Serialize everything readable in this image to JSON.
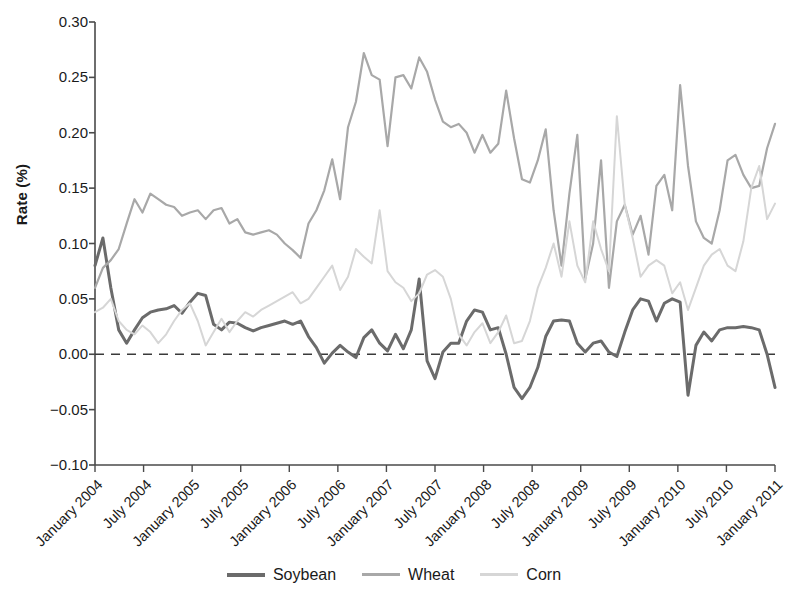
{
  "chart_data": {
    "type": "line",
    "title": "",
    "xlabel": "",
    "ylabel": "Rate (%)",
    "ylim": [
      -0.1,
      0.3
    ],
    "yticks": [
      0.3,
      0.25,
      0.2,
      0.15,
      0.1,
      0.05,
      0.0,
      -0.05,
      -0.1
    ],
    "ytick_labels": [
      "0.30",
      "0.25",
      "0.20",
      "0.15",
      "0.10",
      "0.05",
      "0.00",
      "-0.05",
      "-0.10"
    ],
    "grid": false,
    "zero_line": {
      "value": 0.0,
      "style": "dashed",
      "color": "#3a3a3a"
    },
    "legend_position": "bottom-center",
    "x_tick_labels": [
      "January 2004",
      "July 2004",
      "January 2005",
      "July 2005",
      "January 2006",
      "July 2006",
      "January 2007",
      "July 2007",
      "January 2008",
      "July 2008",
      "January 2009",
      "July 2009",
      "January 2010",
      "July 2010",
      "January 2011"
    ],
    "x_start": "January 2004",
    "x_end": "January 2011",
    "x_interval_months": 1,
    "series": [
      {
        "name": "Soybean",
        "color": "#6b6b6b",
        "width": 3.0,
        "values": [
          0.08,
          0.105,
          0.06,
          0.022,
          0.01,
          0.022,
          0.033,
          0.038,
          0.04,
          0.041,
          0.044,
          0.037,
          0.047,
          0.055,
          0.053,
          0.027,
          0.022,
          0.029,
          0.028,
          0.024,
          0.021,
          0.024,
          0.026,
          0.028,
          0.03,
          0.027,
          0.03,
          0.016,
          0.006,
          -0.008,
          0.001,
          0.008,
          0.002,
          -0.003,
          0.015,
          0.022,
          0.01,
          0.003,
          0.018,
          0.005,
          0.022,
          0.068,
          -0.006,
          -0.022,
          0.002,
          0.01,
          0.01,
          0.03,
          0.04,
          0.038,
          0.022,
          0.024,
          0.0,
          -0.03,
          -0.04,
          -0.03,
          -0.012,
          0.016,
          0.03,
          0.031,
          0.03,
          0.01,
          0.002,
          0.01,
          0.012,
          0.002,
          -0.002,
          0.02,
          0.04,
          0.05,
          0.048,
          0.03,
          0.046,
          0.05,
          0.047,
          -0.037,
          0.008,
          0.02,
          0.012,
          0.022,
          0.024,
          0.024,
          0.025,
          0.024,
          0.022,
          0.0,
          -0.03
        ]
      },
      {
        "name": "Wheat",
        "color": "#a8a8a8",
        "width": 2.2,
        "values": [
          0.06,
          0.078,
          0.085,
          0.095,
          0.118,
          0.14,
          0.128,
          0.145,
          0.14,
          0.135,
          0.133,
          0.125,
          0.128,
          0.13,
          0.122,
          0.13,
          0.132,
          0.118,
          0.122,
          0.11,
          0.108,
          0.11,
          0.112,
          0.108,
          0.1,
          0.094,
          0.087,
          0.118,
          0.13,
          0.148,
          0.176,
          0.14,
          0.205,
          0.228,
          0.272,
          0.252,
          0.248,
          0.188,
          0.25,
          0.252,
          0.24,
          0.268,
          0.255,
          0.23,
          0.21,
          0.205,
          0.208,
          0.2,
          0.182,
          0.198,
          0.182,
          0.19,
          0.238,
          0.195,
          0.158,
          0.155,
          0.175,
          0.203,
          0.13,
          0.08,
          0.145,
          0.198,
          0.068,
          0.1,
          0.175,
          0.06,
          0.12,
          0.135,
          0.108,
          0.125,
          0.09,
          0.152,
          0.162,
          0.13,
          0.243,
          0.17,
          0.12,
          0.105,
          0.1,
          0.13,
          0.175,
          0.18,
          0.162,
          0.15,
          0.152,
          0.186,
          0.208
        ]
      },
      {
        "name": "Corn",
        "color": "#d6d6d6",
        "width": 2.0,
        "values": [
          0.038,
          0.042,
          0.05,
          0.03,
          0.022,
          0.018,
          0.026,
          0.02,
          0.01,
          0.018,
          0.03,
          0.04,
          0.046,
          0.03,
          0.008,
          0.02,
          0.032,
          0.02,
          0.03,
          0.038,
          0.034,
          0.04,
          0.044,
          0.048,
          0.052,
          0.056,
          0.046,
          0.05,
          0.06,
          0.07,
          0.08,
          0.058,
          0.07,
          0.095,
          0.088,
          0.082,
          0.13,
          0.075,
          0.065,
          0.06,
          0.048,
          0.055,
          0.072,
          0.076,
          0.07,
          0.05,
          0.018,
          0.008,
          0.02,
          0.028,
          0.01,
          0.02,
          0.035,
          0.01,
          0.012,
          0.03,
          0.06,
          0.078,
          0.1,
          0.07,
          0.12,
          0.08,
          0.065,
          0.12,
          0.095,
          0.075,
          0.215,
          0.135,
          0.105,
          0.07,
          0.08,
          0.085,
          0.08,
          0.055,
          0.065,
          0.04,
          0.06,
          0.08,
          0.09,
          0.095,
          0.08,
          0.075,
          0.102,
          0.15,
          0.17,
          0.122,
          0.136
        ]
      }
    ]
  },
  "legend": {
    "items": [
      {
        "label": "Soybean"
      },
      {
        "label": "Wheat"
      },
      {
        "label": "Corn"
      }
    ]
  },
  "axes": {
    "y_axis_title": "Rate (%)"
  }
}
